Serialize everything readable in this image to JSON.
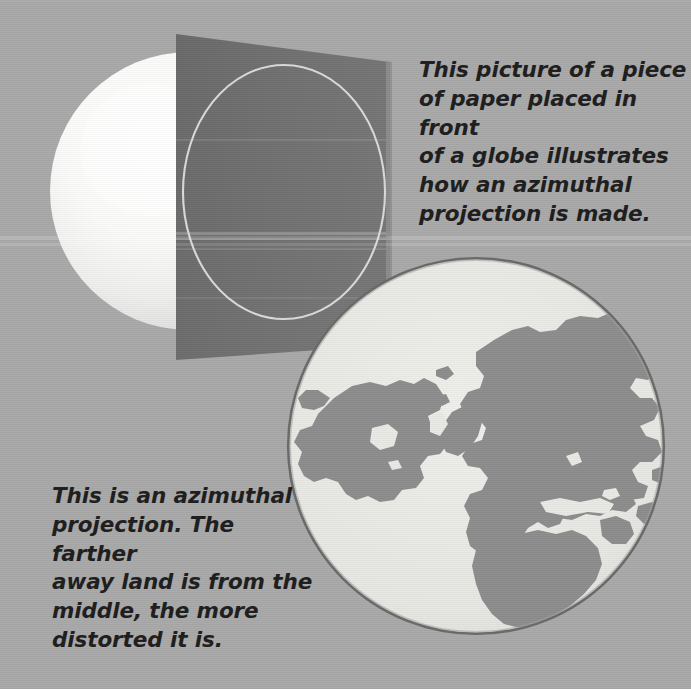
{
  "page": {
    "width": 691,
    "height": 689,
    "background_color": "#a9a9a9",
    "kind": "textbook-illustration"
  },
  "captions": {
    "paper_globe": "This picture of a piece\nof paper placed in front\nof a globe illustrates\nhow an azimuthal\nprojection is made.",
    "azimuthal_projection": "This is an azimuthal\nprojection. The farther\naway land is from the\nmiddle, the more\ndistorted it is."
  },
  "figures": {
    "globe_sphere": {
      "label": "globe",
      "center_x": 189,
      "center_y": 191,
      "radius": 139,
      "highlight_color": "#ffffff",
      "shadow_color": "#c9c9c9"
    },
    "paper_sheet": {
      "label": "sheet of paper",
      "fill_color": "#6e6e6e",
      "edge_color": "#8d8d8d",
      "corners": "176,34 390,62 390,345 176,360"
    },
    "projected_circle": {
      "label": "projected outline on paper",
      "center_x": 284,
      "center_y": 192,
      "radius_x": 101,
      "radius_y": 127,
      "stroke_color": "#dcdcdc"
    },
    "azimuthal_map": {
      "label": "azimuthal projection map",
      "center_x": 476,
      "center_y": 446,
      "radius": 188,
      "ocean_color": "#e9e9e5",
      "land_color": "#8d8d8d",
      "rim_color": "#6f6f6f",
      "projection_center": "North Pole",
      "landmasses": [
        "North America",
        "Greenland",
        "Eurasia",
        "Africa",
        "Scandinavia",
        "British Isles",
        "Iceland",
        "Arabian Peninsula",
        "India"
      ]
    }
  }
}
